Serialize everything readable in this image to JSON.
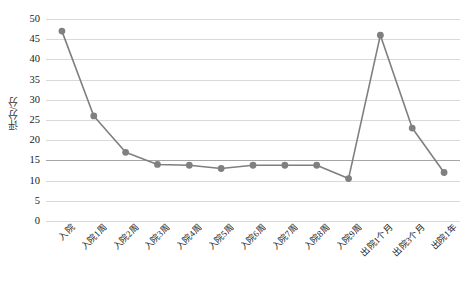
{
  "chart_data": {
    "type": "line",
    "title": "",
    "xlabel": "",
    "ylabel": "评分/分",
    "ylim": [
      0,
      50
    ],
    "yticks": [
      0,
      5,
      10,
      15,
      20,
      25,
      30,
      35,
      40,
      45,
      50
    ],
    "grid": true,
    "legend": "none",
    "line_color": "#7f7f7f",
    "marker_color": "#808080",
    "marker_shape": "circle",
    "categories": [
      "入院",
      "入院1周",
      "入院2周",
      "入院3周",
      "入院4周",
      "入院5周",
      "入院6周",
      "入院7周",
      "入院8周",
      "入院9周",
      "出院1个月",
      "出院3个月",
      "出院1年"
    ],
    "values": [
      47,
      26,
      17,
      14,
      13.8,
      13,
      13.8,
      13.8,
      13.8,
      10.5,
      46,
      23,
      12
    ]
  },
  "axes": {
    "y_title": "评分/分",
    "y_tick_labels": [
      "50",
      "45",
      "40",
      "35",
      "30",
      "25",
      "20",
      "15",
      "10",
      "5",
      "0"
    ]
  }
}
